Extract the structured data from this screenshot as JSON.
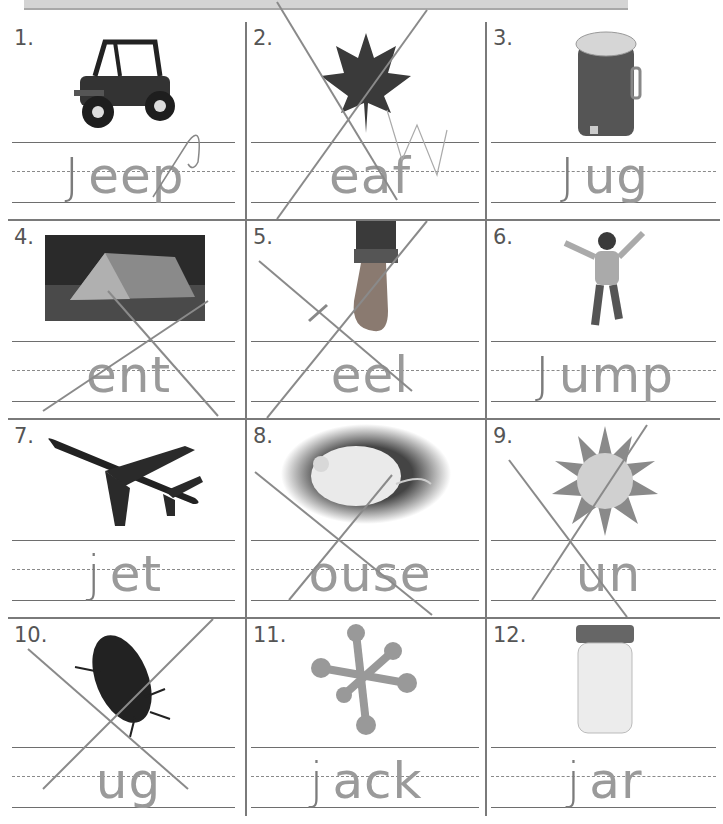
{
  "worksheet": {
    "header_band": "",
    "items": [
      {
        "number": "1.",
        "picture": "jeep",
        "prefix": "J",
        "printed": "eep",
        "crossed": false
      },
      {
        "number": "2.",
        "picture": "leaf",
        "prefix": "",
        "printed": "eaf",
        "crossed": true
      },
      {
        "number": "3.",
        "picture": "jug",
        "prefix": "J",
        "printed": "ug",
        "crossed": false
      },
      {
        "number": "4.",
        "picture": "tent",
        "prefix": "",
        "printed": "ent",
        "crossed": true
      },
      {
        "number": "5.",
        "picture": "heel",
        "prefix": "",
        "printed": "eel",
        "crossed": true
      },
      {
        "number": "6.",
        "picture": "jump",
        "prefix": "J",
        "printed": "ump",
        "crossed": false
      },
      {
        "number": "7.",
        "picture": "jet",
        "prefix": "j",
        "printed": "et",
        "crossed": false
      },
      {
        "number": "8.",
        "picture": "mouse",
        "prefix": "",
        "printed": "ouse",
        "crossed": true
      },
      {
        "number": "9.",
        "picture": "sun",
        "prefix": "",
        "printed": "un",
        "crossed": true
      },
      {
        "number": "10.",
        "picture": "bug",
        "prefix": "",
        "printed": "ug",
        "crossed": true
      },
      {
        "number": "11.",
        "picture": "jacks",
        "prefix": "j",
        "printed": "ack",
        "crossed": false
      },
      {
        "number": "12.",
        "picture": "jar",
        "prefix": "j",
        "printed": "ar",
        "crossed": false
      }
    ]
  },
  "colors": {
    "grid_line": "#7a7a7a",
    "printed_letters": "#9a9a9a",
    "pencil": "#7c7c7c",
    "header_band": "#d4d4d4"
  }
}
